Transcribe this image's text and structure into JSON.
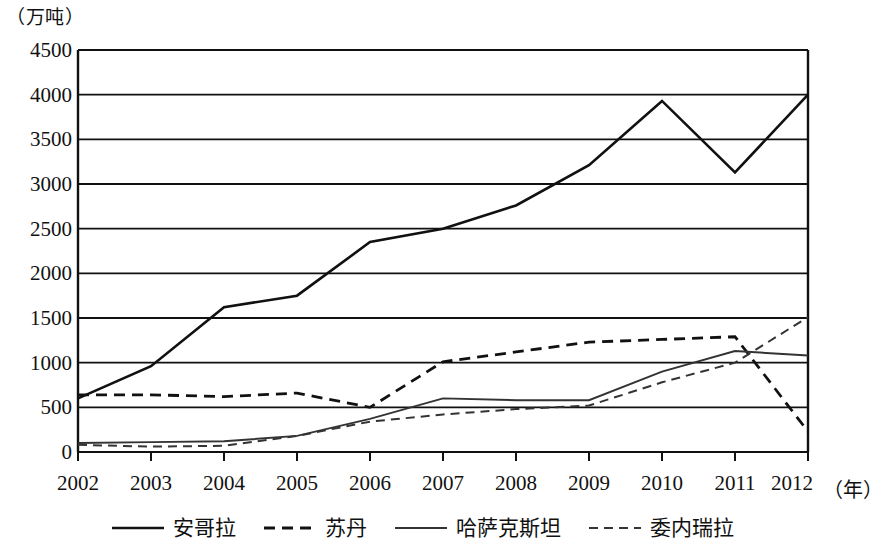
{
  "axis": {
    "y_unit_label": "（万吨）",
    "y_ticks": [
      "4500",
      "4000",
      "3500",
      "3000",
      "2500",
      "2000",
      "1500",
      "1000",
      "500",
      "0"
    ],
    "x_ticks": [
      "2002",
      "2003",
      "2004",
      "2005",
      "2006",
      "2007",
      "2008",
      "2009",
      "2010",
      "2011",
      "2012"
    ],
    "x_unit_label": "（年）"
  },
  "legend": {
    "items": [
      {
        "label": "安哥拉",
        "style": "solid-thick",
        "color": "#111111"
      },
      {
        "label": "苏丹",
        "style": "dashed-thick",
        "color": "#111111"
      },
      {
        "label": "哈萨克斯坦",
        "style": "solid-thin",
        "color": "#333333"
      },
      {
        "label": "委内瑞拉",
        "style": "dashed-thin",
        "color": "#333333"
      }
    ]
  },
  "chart_data": {
    "type": "line",
    "title": "",
    "xlabel": "（年）",
    "ylabel": "（万吨）",
    "x": [
      2002,
      2003,
      2004,
      2005,
      2006,
      2007,
      2008,
      2009,
      2010,
      2011,
      2012
    ],
    "categories": [
      "2002",
      "2003",
      "2004",
      "2005",
      "2006",
      "2007",
      "2008",
      "2009",
      "2010",
      "2011",
      "2012"
    ],
    "ylim": [
      0,
      4500
    ],
    "xlim": [
      2002,
      2012
    ],
    "ytick_step": 500,
    "grid": "horizontal",
    "legend_position": "bottom",
    "series": [
      {
        "name": "安哥拉",
        "style": "solid-thick",
        "color": "#111111",
        "values": [
          600,
          960,
          1620,
          1750,
          2350,
          2500,
          2760,
          3210,
          3930,
          3130,
          4000
        ]
      },
      {
        "name": "苏丹",
        "style": "dashed-thick",
        "color": "#111111",
        "values": [
          640,
          640,
          620,
          660,
          500,
          1010,
          1120,
          1230,
          1260,
          1290,
          230
        ]
      },
      {
        "name": "哈萨克斯坦",
        "style": "solid-thin",
        "color": "#333333",
        "values": [
          100,
          110,
          120,
          180,
          370,
          600,
          580,
          580,
          900,
          1130,
          1080
        ]
      },
      {
        "name": "委内瑞拉",
        "style": "dashed-thin",
        "color": "#333333",
        "values": [
          80,
          60,
          70,
          180,
          340,
          420,
          480,
          520,
          780,
          1000,
          1510
        ]
      }
    ]
  }
}
